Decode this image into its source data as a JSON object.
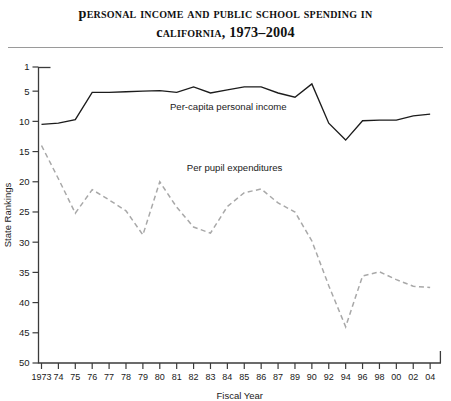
{
  "title": {
    "line1": "Personal Income and Public School Spending in",
    "line2": "California, 1973–2004"
  },
  "chart_data": {
    "type": "line",
    "title": "Personal Income and Public School Spending in California, 1973–2004",
    "xlabel": "Fiscal Year",
    "ylabel": "State Rankings",
    "grid": false,
    "legend_position": "inline-annotation",
    "y_inverted": true,
    "ylim": [
      1,
      50
    ],
    "yticks": [
      1,
      5,
      10,
      15,
      20,
      25,
      30,
      35,
      40,
      45,
      50
    ],
    "ytick_labels": [
      "1",
      "5",
      "10",
      "15",
      "20",
      "25",
      "30",
      "35",
      "40",
      "45",
      "50"
    ],
    "x": [
      1973,
      1974,
      1975,
      1976,
      1977,
      1978,
      1979,
      1980,
      1981,
      1982,
      1983,
      1984,
      1985,
      1986,
      1987,
      1989,
      1990,
      1992,
      1994,
      1996,
      1998,
      2000,
      2002,
      2004
    ],
    "xtick_labels": [
      "1973",
      "74",
      "75",
      "76",
      "77",
      "78",
      "79",
      "80",
      "81",
      "82",
      "83",
      "84",
      "85",
      "86",
      "87",
      "89",
      "90",
      "92",
      "94",
      "96",
      "98",
      "00",
      "02",
      "04"
    ],
    "series": [
      {
        "name": "Per-capita personal income",
        "style": "solid",
        "color": "#1c1c1c",
        "values": [
          10.5,
          10.3,
          9.7,
          5.2,
          5.2,
          5.1,
          5.0,
          4.9,
          5.2,
          4.3,
          5.3,
          4.8,
          4.3,
          4.3,
          5.3,
          6.0,
          3.8,
          10.3,
          13.1,
          9.9,
          9.8,
          9.8,
          9.1,
          8.8
        ]
      },
      {
        "name": "Per pupil expenditures",
        "style": "dashed",
        "color": "#a8a8a8",
        "values": [
          14.0,
          19.5,
          25.2,
          21.3,
          23.0,
          24.8,
          28.8,
          20.0,
          24.2,
          27.5,
          28.5,
          24.1,
          21.8,
          21.2,
          23.5,
          25.0,
          29.8,
          37.2,
          44.0,
          35.6,
          34.9,
          36.2,
          37.3,
          37.5
        ]
      }
    ],
    "annotations": [
      {
        "text": "Per-capita personal income",
        "x": 1980.6,
        "y": 8.2
      },
      {
        "text": "Per pupil expenditures",
        "x": 1981.6,
        "y": 18.2
      }
    ]
  }
}
